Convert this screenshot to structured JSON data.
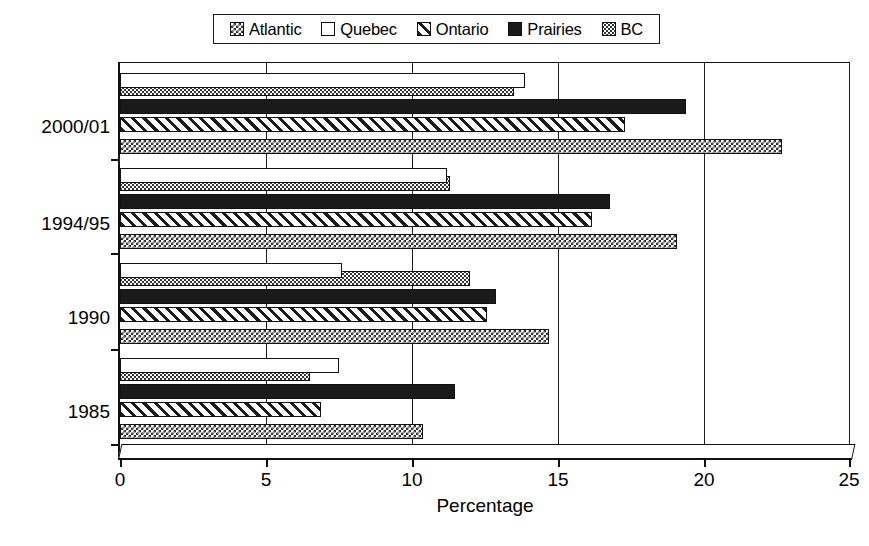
{
  "chart_data": {
    "type": "bar",
    "orientation": "horizontal",
    "title": "",
    "xlabel": "Percentage",
    "ylabel": "Survey",
    "xlim": [
      0,
      25
    ],
    "xticks": [
      0,
      5,
      10,
      15,
      20,
      25
    ],
    "grid": true,
    "legend_position": "top",
    "categories": [
      "1985",
      "1990",
      "1994/95",
      "2000/01"
    ],
    "series": [
      {
        "name": "Atlantic",
        "pattern": "checkerboard",
        "values": [
          10.4,
          14.7,
          19.1,
          22.7
        ]
      },
      {
        "name": "Quebec",
        "pattern": "empty",
        "values": [
          7.5,
          7.6,
          11.2,
          13.9
        ]
      },
      {
        "name": "Ontario",
        "pattern": "diagonal-hatch",
        "values": [
          6.9,
          12.6,
          16.2,
          17.3
        ]
      },
      {
        "name": "Prairies",
        "pattern": "solid",
        "values": [
          11.5,
          12.9,
          16.8,
          19.4
        ]
      },
      {
        "name": "BC",
        "pattern": "fine-dots",
        "values": [
          6.5,
          12.0,
          11.3,
          13.5
        ]
      }
    ]
  },
  "legend": {
    "items": [
      {
        "label": "Atlantic",
        "swatch": "checkerboard-swatch"
      },
      {
        "label": "Quebec",
        "swatch": "empty-swatch"
      },
      {
        "label": "Ontario",
        "swatch": "hatch-swatch"
      },
      {
        "label": "Prairies",
        "swatch": "solid-swatch"
      },
      {
        "label": "BC",
        "swatch": "dots-swatch"
      }
    ]
  },
  "axes": {
    "x_title": "Percentage",
    "y_title": "Survey",
    "x_tick_labels": [
      "0",
      "5",
      "10",
      "15",
      "20",
      "25"
    ],
    "y_tick_labels": [
      "2000/01",
      "1994/95",
      "1990",
      "1985"
    ]
  },
  "colors": {
    "ink": "#111111",
    "background": "#ffffff",
    "solid_fill": "#1a1a1a"
  }
}
